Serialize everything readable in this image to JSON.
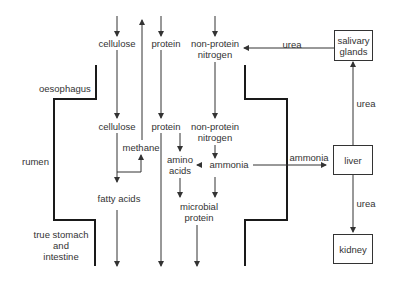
{
  "diagram": {
    "regions": {
      "oesophagus": "oesophagus",
      "rumen": "rumen",
      "true_stomach": "true stomach\nand\nintestine"
    },
    "nodes": {
      "cellulose_top": "cellulose",
      "protein_top": "protein",
      "npn_top_1": "non-protein",
      "npn_top_2": "nitrogen",
      "cellulose_rumen": "cellulose",
      "protein_rumen": "protein",
      "npn_rumen_1": "non-protein",
      "npn_rumen_2": "nitrogen",
      "methane": "methane",
      "amino_1": "amino",
      "amino_2": "acids",
      "ammonia": "ammonia",
      "fatty_acids": "fatty acids",
      "microbial_1": "microbial",
      "microbial_2": "protein"
    },
    "organs": {
      "salivary_1": "salivary",
      "salivary_2": "glands",
      "liver": "liver",
      "kidney": "kidney"
    },
    "edge_labels": {
      "urea_saliva_to_npn": "urea",
      "urea_liver_to_saliva": "urea",
      "ammonia_to_liver": "ammonia",
      "urea_liver_to_kidney": "urea"
    },
    "colors": {
      "line": "#333333",
      "wall": "#1a1a1a",
      "text": "#333333"
    }
  }
}
